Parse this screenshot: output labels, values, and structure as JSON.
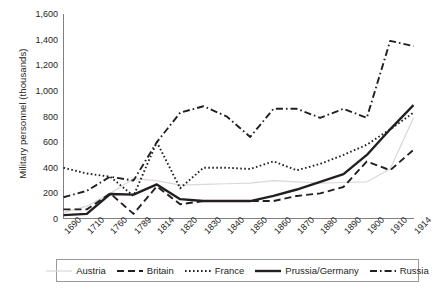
{
  "chart_data": {
    "type": "line",
    "title": "",
    "xlabel": "",
    "ylabel": "Military personnel (thousands)",
    "categories": [
      "1690",
      "1710",
      "1760",
      "1789",
      "1814",
      "1820",
      "1830",
      "1840",
      "1850",
      "1860",
      "1870",
      "1880",
      "1890",
      "1900",
      "1910",
      "1914"
    ],
    "ylim": [
      0,
      1600
    ],
    "yticks": [
      "0",
      "200",
      "400",
      "600",
      "800",
      "1,000",
      "1,200",
      "1,400",
      "1,600"
    ],
    "ytick_values": [
      0,
      200,
      400,
      600,
      800,
      1000,
      1200,
      1400,
      1600
    ],
    "grid": false,
    "legend_position": "bottom",
    "series": [
      {
        "name": "Austria",
        "style": "thin-solid-light",
        "color": "#d9d9d9",
        "values": [
          50,
          100,
          200,
          315,
          300,
          265,
          270,
          275,
          280,
          300,
          290,
          280,
          285,
          290,
          390,
          790
        ]
      },
      {
        "name": "Britain",
        "style": "dashed",
        "color": "#231f20",
        "values": [
          75,
          75,
          200,
          40,
          255,
          115,
          140,
          140,
          140,
          140,
          180,
          200,
          250,
          450,
          380,
          540
        ]
      },
      {
        "name": "France",
        "style": "dotted",
        "color": "#231f20",
        "values": [
          400,
          355,
          330,
          180,
          600,
          240,
          400,
          400,
          390,
          450,
          380,
          430,
          500,
          580,
          700,
          830
        ]
      },
      {
        "name": "Prussia/Germany",
        "style": "thick-solid",
        "color": "#231f20",
        "values": [
          30,
          40,
          195,
          190,
          270,
          155,
          140,
          140,
          140,
          180,
          230,
          290,
          350,
          500,
          700,
          890
        ]
      },
      {
        "name": "Russia",
        "style": "dash-dot",
        "color": "#231f20",
        "values": [
          170,
          220,
          330,
          300,
          600,
          830,
          880,
          800,
          640,
          860,
          860,
          790,
          860,
          790,
          1390,
          1350
        ]
      }
    ]
  },
  "legend": {
    "items": [
      {
        "label": "Austria"
      },
      {
        "label": "Britain"
      },
      {
        "label": "France"
      },
      {
        "label": "Prussia/Germany"
      },
      {
        "label": "Russia"
      }
    ]
  }
}
